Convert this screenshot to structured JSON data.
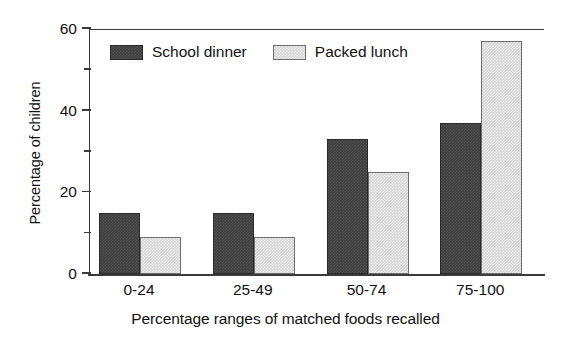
{
  "chart_data": {
    "type": "bar",
    "title": "",
    "subtitle": "",
    "xlabel": "Percentage ranges of matched foods recalled",
    "ylabel": "Percentage of children",
    "categories": [
      "0-24",
      "25-49",
      "50-74",
      "75-100"
    ],
    "series": [
      {
        "name": "School dinner",
        "color": "#3f3f3f",
        "values": [
          15,
          15,
          33,
          37
        ]
      },
      {
        "name": "Packed lunch",
        "color": "#d6d6d6",
        "values": [
          9,
          9,
          25,
          57
        ]
      }
    ],
    "ylim": [
      0,
      60
    ],
    "xlim_note": "categorical",
    "y_major_ticks": [
      0,
      20,
      40,
      60
    ],
    "y_minor_ticks": [
      10,
      30,
      50
    ],
    "y_tick_labels": [
      "0",
      "20",
      "40",
      "60"
    ],
    "grid": false,
    "legend_position": "top-left-inside",
    "annotations": []
  },
  "axes": {
    "y_title": "Percentage of children",
    "x_title": "Percentage ranges of matched foods recalled",
    "y_labels": [
      "60",
      "40",
      "20",
      "0"
    ],
    "x_labels": [
      "0-24",
      "25-49",
      "50-74",
      "75-100"
    ]
  },
  "legend": {
    "items": [
      {
        "label": "School dinner",
        "swatch": "dark-swatch-icon"
      },
      {
        "label": "Packed lunch",
        "swatch": "light-swatch-icon"
      }
    ]
  }
}
